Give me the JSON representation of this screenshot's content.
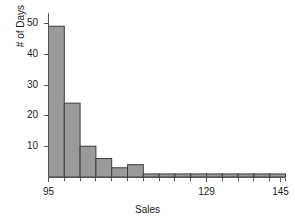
{
  "chart_data": {
    "type": "bar",
    "title": "",
    "subtitle": "",
    "xlabel": "Sales",
    "ylabel": "# of Days",
    "bin_width": 3.4,
    "bin_start": 95,
    "bin_end": 146.6,
    "categories": [
      "95-98.4",
      "98.4-101.8",
      "101.8-105.2",
      "105.2-108.6",
      "108.6-112",
      "112-115.4",
      "115.4-118.8",
      "118.8-122.2",
      "122.2-125.6",
      "125.6-129",
      "129-132.4",
      "132.4-135.8",
      "135.8-139.2",
      "139.2-142.6",
      "142.6-146"
    ],
    "values": [
      49,
      24,
      10,
      6,
      3,
      4,
      1,
      1,
      1,
      1,
      1,
      1,
      1,
      1,
      1
    ],
    "xlim": [
      95,
      146
    ],
    "ylim": [
      0,
      52
    ],
    "xticks": [
      95,
      129,
      145
    ],
    "xtick_labels": [
      "95",
      "129",
      "145"
    ],
    "yticks": [
      10,
      20,
      30,
      40,
      50
    ],
    "ytick_labels": [
      "10",
      "20",
      "30",
      "40",
      "50"
    ],
    "grid": false,
    "legend": false,
    "legend_position": "none",
    "bar_fill_color": "#9a9a9a",
    "bar_edge_color": "#3d3d3d",
    "axis_color": "#555555"
  }
}
